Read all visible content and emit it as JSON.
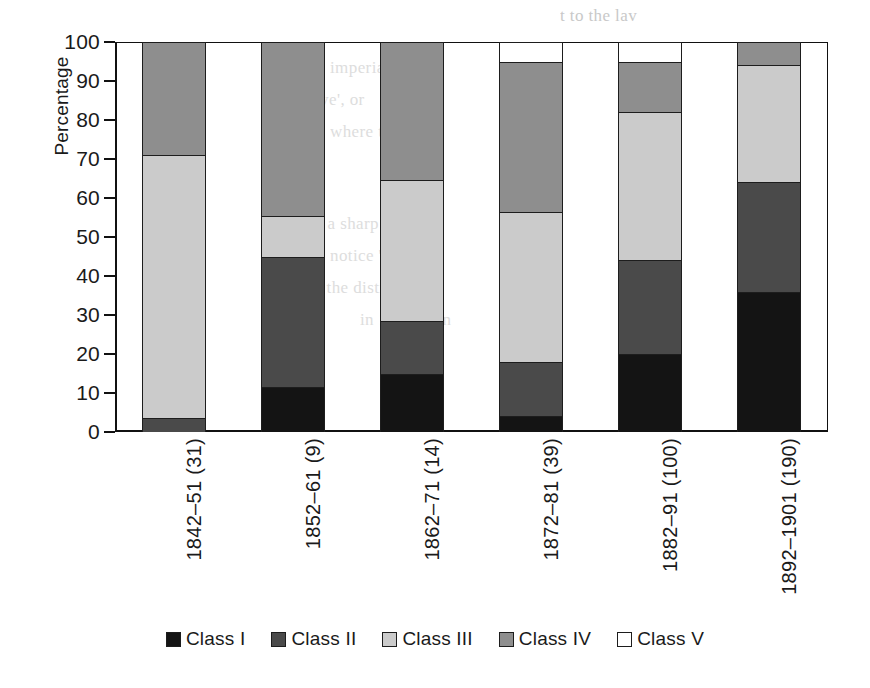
{
  "chart_data": {
    "type": "bar",
    "subtype": "stacked-bar-100",
    "title": "",
    "xlabel": "",
    "ylabel": "Percentage",
    "ylim": [
      0,
      100
    ],
    "yticks": [
      0,
      10,
      20,
      30,
      40,
      50,
      60,
      70,
      80,
      90,
      100
    ],
    "grid": false,
    "legend_position": "bottom",
    "categories": [
      "1842–51 (31)",
      "1852–61 (9)",
      "1862–71 (14)",
      "1872–81 (39)",
      "1882–91 (100)",
      "1892–1901 (190)"
    ],
    "series": [
      {
        "name": "Class I",
        "color": "#141414",
        "values": [
          0,
          11.5,
          15,
          4,
          20,
          36
        ]
      },
      {
        "name": "Class II",
        "color": "#4a4a4a",
        "values": [
          3.5,
          33.5,
          13.5,
          14,
          24,
          28
        ]
      },
      {
        "name": "Class III",
        "color": "#cbcbcb",
        "values": [
          67.5,
          10.5,
          36,
          38.5,
          38,
          30
        ]
      },
      {
        "name": "Class IV",
        "color": "#8e8e8e",
        "values": [
          29,
          44.5,
          35.5,
          38.5,
          13,
          6
        ]
      },
      {
        "name": "Class V",
        "color": "#ffffff",
        "values": [
          0,
          0,
          0,
          5,
          5,
          0
        ]
      }
    ]
  },
  "axis": {
    "y_title": "Percentage",
    "y_tick_labels": [
      "100",
      "90",
      "80",
      "70",
      "60",
      "50",
      "40",
      "30",
      "20",
      "10",
      "0"
    ]
  },
  "legend": {
    "items": [
      {
        "label": "Class I",
        "swatch": "legend-swatch-class-i"
      },
      {
        "label": "Class II",
        "swatch": "legend-swatch-class-ii"
      },
      {
        "label": "Class III",
        "swatch": "legend-swatch-class-iii"
      },
      {
        "label": "Class IV",
        "swatch": "legend-swatch-class-iv"
      },
      {
        "label": "Class V",
        "swatch": "legend-swatch-class-v"
      }
    ]
  },
  "background_text": {
    "lines": [
      "t to the lav",
      "imperial ra",
      "drive',  or",
      "where the",
      "ing a sharp c",
      "notice 'spe",
      "ils, the disti",
      "in 1892 'prin"
    ]
  }
}
